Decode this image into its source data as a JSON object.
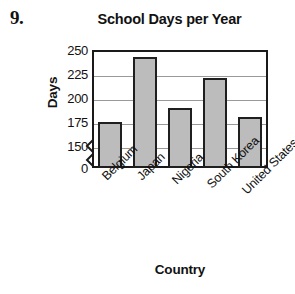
{
  "problem": {
    "number": "9."
  },
  "chart_data": {
    "type": "bar",
    "title": "School Days per Year",
    "xlabel": "Country",
    "ylabel": "Days",
    "categories": [
      "Belgium",
      "Japan",
      "Nigeria",
      "South Korea",
      "United States"
    ],
    "values": [
      175,
      243,
      190,
      221,
      180
    ],
    "ylim": [
      150,
      250
    ],
    "y_axis_break": true,
    "y_ticks": [
      {
        "label": "250",
        "value": 250
      },
      {
        "label": "225",
        "value": 225
      },
      {
        "label": "200",
        "value": 200
      },
      {
        "label": "175",
        "value": 175
      },
      {
        "label": "150",
        "value": 150
      },
      {
        "label": "0",
        "value": 0
      }
    ],
    "grid": "horizontal",
    "legend": "none",
    "bar_fill_color": "#bcbcbc",
    "bar_border_color": "#1f1f1f",
    "axis_color": "#1a1a1a",
    "gridline_color": "#9a9a9a",
    "background_color": "#ffffff"
  }
}
